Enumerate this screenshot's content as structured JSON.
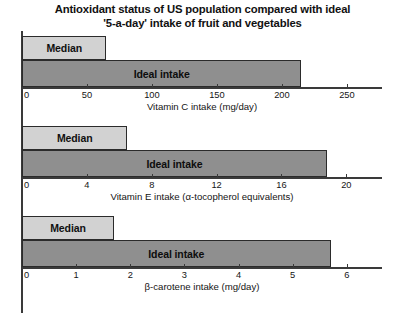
{
  "title": {
    "line1": "Antioxidant status of US population compared with ideal",
    "line2": "'5-a-day' intake of fruit and vegetables"
  },
  "labels": {
    "median": "Median",
    "ideal": "Ideal intake"
  },
  "chart_data": [
    {
      "type": "bar",
      "orientation": "horizontal",
      "title": "Antioxidant status of US population compared with ideal '5-a-day' intake of fruit and vegetables",
      "xlabel": "Vitamin C intake (mg/day)",
      "ylabel": "",
      "categories": [
        "Median",
        "Ideal intake"
      ],
      "values": [
        65,
        215
      ],
      "xlim": [
        0,
        277
      ],
      "ticks": [
        0,
        50,
        100,
        150,
        200,
        250
      ],
      "tick_labels": [
        "0",
        "50",
        "100",
        "150",
        "200",
        "250"
      ],
      "grid": false,
      "legend": "none",
      "bar_colors": [
        "#d2d2d2",
        "#8f8f8f"
      ]
    },
    {
      "type": "bar",
      "orientation": "horizontal",
      "title": "",
      "xlabel": "Vitamin E intake (α-tocopherol equivalents)",
      "ylabel": "",
      "categories": [
        "Median",
        "Ideal intake"
      ],
      "values": [
        6.5,
        18.8
      ],
      "xlim": [
        0,
        22.2
      ],
      "ticks": [
        0,
        4,
        8,
        12,
        16,
        20
      ],
      "tick_labels": [
        "0",
        "4",
        "8",
        "12",
        "16",
        "20"
      ],
      "grid": false,
      "legend": "none",
      "bar_colors": [
        "#d2d2d2",
        "#8f8f8f"
      ]
    },
    {
      "type": "bar",
      "orientation": "horizontal",
      "title": "",
      "xlabel": "β-carotene intake (mg/day)",
      "ylabel": "",
      "categories": [
        "Median",
        "Ideal intake"
      ],
      "values": [
        1.7,
        5.7
      ],
      "xlim": [
        0,
        6.65
      ],
      "ticks": [
        0,
        1,
        2,
        3,
        4,
        5,
        6
      ],
      "tick_labels": [
        "0",
        "1",
        "2",
        "3",
        "4",
        "5",
        "6"
      ],
      "grid": false,
      "legend": "none",
      "bar_colors": [
        "#d2d2d2",
        "#8f8f8f"
      ]
    }
  ]
}
